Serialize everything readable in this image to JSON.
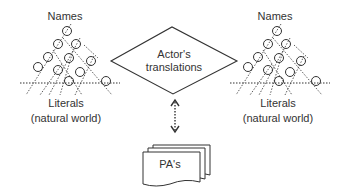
{
  "left_network": {
    "top_label": "Names",
    "bottom_label_line1": "Literals",
    "bottom_label_line2": "(natural world)"
  },
  "right_network": {
    "top_label": "Names",
    "bottom_label_line1": "Literals",
    "bottom_label_line2": "(natural world)"
  },
  "center_diamond": {
    "line1": "Actor's",
    "line2": "translations"
  },
  "connector": {
    "type": "dotted-double-arrow"
  },
  "documents": {
    "label": "PA's"
  },
  "colors": {
    "stroke": "#333333",
    "background": "#ffffff"
  }
}
